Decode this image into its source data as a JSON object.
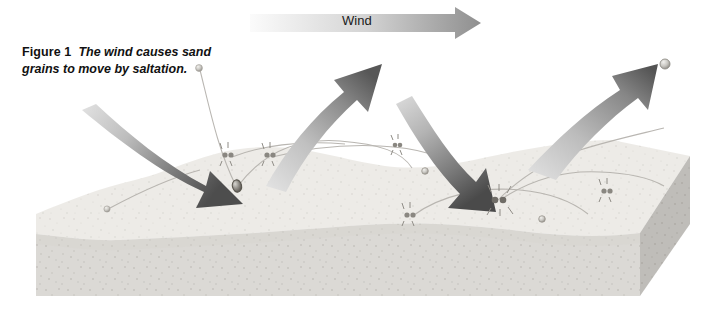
{
  "figure": {
    "caption_label": "Figure 1",
    "caption_text": "The wind causes sand grains to move by saltation.",
    "background_color": "#ffffff"
  },
  "wind_arrow": {
    "label": "Wind",
    "direction": "left-to-right",
    "gradient_from": "#f7f7f7",
    "gradient_to": "#8f8f8f",
    "x_start": 250,
    "x_end": 480,
    "y_center": 23
  },
  "sand_block": {
    "top_surface_color": "#eceae6",
    "front_face_color": "#d8d6d2",
    "right_face_color": "#bcbab6",
    "texture": "speckled-sand-grains",
    "left_edge_x": 36,
    "right_edge_x": 690,
    "top_y": 150,
    "bottom_y": 300
  },
  "motion_arrows": [
    {
      "name": "arrow-impact-left",
      "style": "curved-descending",
      "description": "Wind-driven grain descends and strikes the sand surface",
      "color_from": "#cfcfcf",
      "color_to": "#4a4a4a"
    },
    {
      "name": "arrow-rebound-center",
      "style": "curved-ascending",
      "description": "Grain rebounds upward after impact",
      "color_from": "#cfcfcf",
      "color_to": "#555555"
    },
    {
      "name": "arrow-impact-right",
      "style": "curved-descending",
      "description": "Grain descends again downwind and impacts",
      "color_from": "#cfcfcf",
      "color_to": "#4a4a4a"
    },
    {
      "name": "arrow-rebound-right",
      "style": "curved-ascending",
      "description": "Grain rebounds and continues downwind",
      "color_from": "#cfcfcf",
      "color_to": "#555555"
    }
  ],
  "sand_grains": [
    {
      "name": "grain-airborne-upper-left",
      "x": 199,
      "y": 68,
      "size": 5
    },
    {
      "name": "grain-airborne-upper-right",
      "x": 664,
      "y": 64,
      "size": 7
    },
    {
      "name": "grain-impact-left",
      "x": 237,
      "y": 186,
      "size": 9
    },
    {
      "name": "grain-surface-left",
      "x": 107,
      "y": 208,
      "size": 6
    },
    {
      "name": "grain-surface-mid",
      "x": 425,
      "y": 171,
      "size": 6
    },
    {
      "name": "grain-surface-right",
      "x": 542,
      "y": 219,
      "size": 6
    },
    {
      "name": "grain-impact-right",
      "x": 498,
      "y": 199,
      "size": 10
    }
  ],
  "impact_splashes": [
    {
      "name": "splash-left-a",
      "x": 228,
      "y": 155
    },
    {
      "name": "splash-left-b",
      "x": 270,
      "y": 155
    },
    {
      "name": "splash-center",
      "x": 410,
      "y": 215
    },
    {
      "name": "splash-right-impact",
      "x": 498,
      "y": 199
    },
    {
      "name": "splash-far-right",
      "x": 607,
      "y": 191
    },
    {
      "name": "splash-upper-right",
      "x": 398,
      "y": 145
    }
  ],
  "trajectory_arcs": {
    "count": 6,
    "color": "#b4b4b4",
    "description": "Thin ballistic saltation paths linking grain impacts"
  }
}
